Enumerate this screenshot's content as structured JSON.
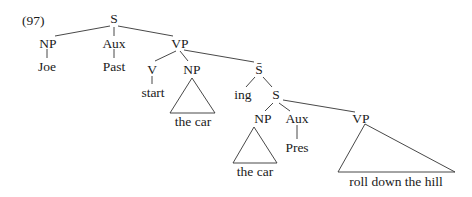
{
  "example_number": "(97)",
  "nodes": {
    "s_root": "S",
    "np_subject": "NP",
    "aux_main": "Aux",
    "vp_main": "VP",
    "v": "V",
    "np_object": "NP",
    "s_bar": "S̄",
    "ing": "ing",
    "s_embedded": "S",
    "np_embedded": "NP",
    "aux_embedded": "Aux",
    "vp_embedded": "VP"
  },
  "leaves": {
    "joe": "Joe",
    "past": "Past",
    "start": "start",
    "object_phrase": "the car",
    "embedded_subject_phrase": "the car",
    "pres": "Pres",
    "embedded_vp_phrase": "roll down the hill"
  }
}
